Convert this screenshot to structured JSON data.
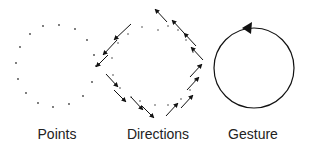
{
  "panels": [
    {
      "id": "points",
      "label": "Points"
    },
    {
      "id": "directions",
      "label": "Directions"
    },
    {
      "id": "gesture",
      "label": "Gesture"
    }
  ],
  "colors": {
    "stroke": "#111111",
    "dot": "#444444",
    "text": "#222222",
    "background": "#ffffff"
  },
  "points": [
    [
      43,
      26
    ],
    [
      59,
      25
    ],
    [
      75,
      29
    ],
    [
      87,
      40
    ],
    [
      94,
      55
    ],
    [
      96,
      66
    ],
    [
      92,
      82
    ],
    [
      83,
      96
    ],
    [
      69,
      104
    ],
    [
      53,
      107
    ],
    [
      38,
      103
    ],
    [
      26,
      93
    ],
    [
      18,
      79
    ],
    [
      16,
      63
    ],
    [
      20,
      47
    ],
    [
      30,
      34
    ]
  ],
  "direction_dots": [
    [
      142,
      27
    ],
    [
      158,
      30
    ],
    [
      128,
      34
    ],
    [
      118,
      43
    ],
    [
      112,
      58
    ],
    [
      113,
      75
    ],
    [
      120,
      88
    ],
    [
      131,
      97
    ],
    [
      140,
      101
    ],
    [
      155,
      105
    ],
    [
      168,
      105
    ],
    [
      181,
      99
    ],
    [
      190,
      90
    ],
    [
      195,
      80
    ],
    [
      198,
      66
    ],
    [
      193,
      52
    ],
    [
      186,
      40
    ],
    [
      178,
      30
    ],
    [
      168,
      26
    ]
  ],
  "direction_arrows": [
    [
      131,
      24,
      114,
      40
    ],
    [
      117,
      40,
      103,
      55
    ],
    [
      108,
      55,
      96,
      67
    ],
    [
      106,
      74,
      118,
      87
    ],
    [
      114,
      90,
      126,
      102
    ],
    [
      131,
      97,
      143,
      110
    ],
    [
      142,
      106,
      154,
      118
    ],
    [
      166,
      116,
      178,
      103
    ],
    [
      181,
      108,
      193,
      95
    ],
    [
      187,
      90,
      199,
      77
    ],
    [
      190,
      77,
      202,
      64
    ],
    [
      203,
      60,
      191,
      47
    ],
    [
      196,
      46,
      184,
      33
    ],
    [
      184,
      33,
      172,
      20
    ],
    [
      167,
      22,
      155,
      9
    ]
  ],
  "gesture": {
    "cx": 254,
    "cy": 68,
    "r": 40,
    "direction": "counterclockwise"
  }
}
